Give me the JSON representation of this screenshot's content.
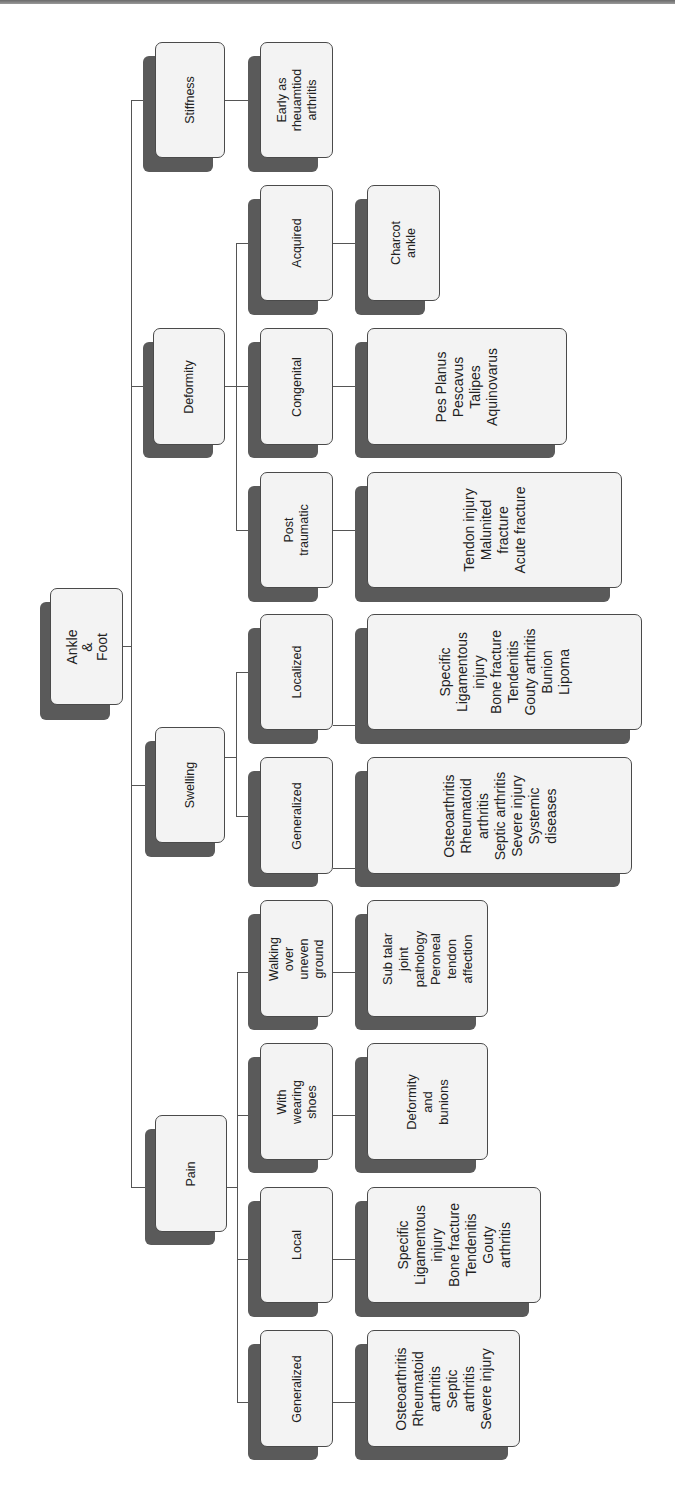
{
  "diagram": {
    "orientation": "rotated-90-ccw",
    "root": {
      "label": "Ankle & Foot"
    },
    "categories": [
      {
        "label": "Stiffness",
        "children": [
          {
            "label": "",
            "detail": "Early as\nrheuamtiod\narthritis"
          }
        ]
      },
      {
        "label": "Deformity",
        "children": [
          {
            "label": "Acquired",
            "detail": "Charcot ankle"
          },
          {
            "label": "Congenital",
            "detail": "Pes Planus\nPescavus\nTalipes\nAquinovarus"
          },
          {
            "label": "Post traumatic",
            "detail": "Tendon injury\nMalunited\nfracture\nAcute fracture"
          }
        ]
      },
      {
        "label": "Swelling",
        "children": [
          {
            "label": "Localized",
            "detail": "Specific\nLigamentous\ninjury\nBone fracture\nTendenitis\nGouty arthritis\nBunion\nLipoma"
          },
          {
            "label": "Generalized",
            "detail": "Osteoarthritis\nRheumatoid\narthritis\nSeptic arthritis\nSevere  injury\nSystemic\ndiseases"
          }
        ]
      },
      {
        "label": "Pain",
        "children": [
          {
            "label": "Walking over\nuneven ground",
            "detail": "Sub talar joint\npathology\nPeroneal\ntendon\naffection"
          },
          {
            "label": "With wearing\nshoes",
            "detail": "Deformity and\nbunions"
          },
          {
            "label": "Local",
            "detail": "Specific\nLigamentous\ninjury\nBone fracture\nTendenitis\nGouty arthritis"
          },
          {
            "label": "Generalized",
            "detail": "Osteoarthritis\nRheumatoid\narthritis\nSeptic arthritis\nSevere  injury"
          }
        ]
      }
    ]
  },
  "colors": {
    "box_fill": "#f3f3f3",
    "box_border": "#4a4a4a",
    "shadow": "#5a5a5a",
    "connector": "#555555"
  }
}
